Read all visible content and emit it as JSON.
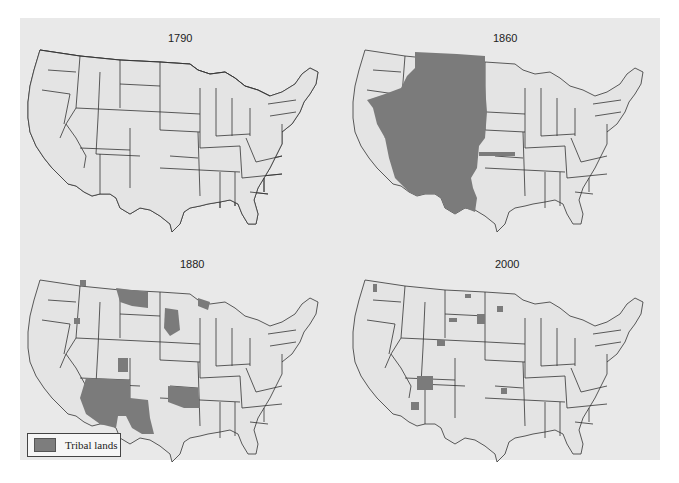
{
  "figure": {
    "legend": {
      "label": "Tribal lands",
      "swatch_color": "#7b7b7b"
    },
    "colors": {
      "background": "#e9e9e9",
      "state_fill": "#e4e4e4",
      "tribal_fill": "#7b7b7b",
      "border": "#333333"
    },
    "maps": [
      {
        "year": "1790",
        "description": "Nearly all land west of the Appalachians and the Mississippi basin is tribal land; eastern seaboard states, Kentucky, parts of Tennessee, eastern Texas and Louisiana are not."
      },
      {
        "year": "1860",
        "description": "Tribal lands cover the Great Plains and Southwest: Montana, Dakotas, Wyoming, Colorado, Nevada, Utah, Arizona, New Mexico, western Texas, eastern Oregon/Idaho."
      },
      {
        "year": "1880",
        "description": "Tribal lands reduced to Indian Territory (Oklahoma), much of Arizona and New Mexico, western Texas strip, and scattered reservations in the Dakotas, Montana, and the Northwest."
      },
      {
        "year": "2000",
        "description": "Only small scattered reservations remain, largest being the Navajo Nation in the Four Corners area, plus patches in the Dakotas, Montana, and Northwest."
      }
    ]
  }
}
